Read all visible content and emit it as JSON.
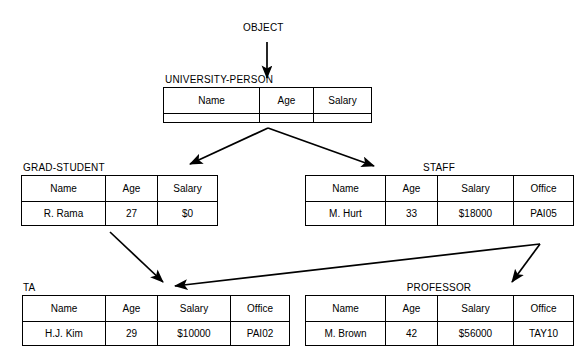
{
  "diagram": {
    "title": "OBJECT",
    "root": {
      "name": "OBJECT"
    },
    "nodes": [
      {
        "id": "university-person",
        "name": "UNIVERSITY-PERSON",
        "columns": [
          "Name",
          "Age",
          "Salary"
        ],
        "rows": [],
        "has_empty_row": true
      },
      {
        "id": "grad-student",
        "name": "GRAD-STUDENT",
        "columns": [
          "Name",
          "Age",
          "Salary"
        ],
        "rows": [
          [
            "R. Rama",
            "27",
            "$0"
          ]
        ],
        "has_empty_row": false
      },
      {
        "id": "staff",
        "name": "STAFF",
        "columns": [
          "Name",
          "Age",
          "Salary",
          "Office"
        ],
        "rows": [
          [
            "M. Hurt",
            "33",
            "$18000",
            "PAI05"
          ]
        ],
        "has_empty_row": false
      },
      {
        "id": "ta",
        "name": "TA",
        "columns": [
          "Name",
          "Age",
          "Salary",
          "Office"
        ],
        "rows": [
          [
            "H.J. Kim",
            "29",
            "$10000",
            "PAI02"
          ]
        ],
        "has_empty_row": false
      },
      {
        "id": "professor",
        "name": "PROFESSOR",
        "columns": [
          "Name",
          "Age",
          "Salary",
          "Office"
        ],
        "rows": [
          [
            "M. Brown",
            "42",
            "$56000",
            "TAY10"
          ]
        ],
        "has_empty_row": false
      }
    ],
    "edges": [
      {
        "from": "OBJECT",
        "to": "UNIVERSITY-PERSON"
      },
      {
        "from": "UNIVERSITY-PERSON",
        "to": "GRAD-STUDENT"
      },
      {
        "from": "UNIVERSITY-PERSON",
        "to": "STAFF"
      },
      {
        "from": "GRAD-STUDENT",
        "to": "TA"
      },
      {
        "from": "STAFF",
        "to": "TA"
      },
      {
        "from": "STAFF",
        "to": "PROFESSOR"
      }
    ],
    "colors": {
      "background": "#ffffff",
      "line": "#000000",
      "text": "#000000"
    }
  }
}
